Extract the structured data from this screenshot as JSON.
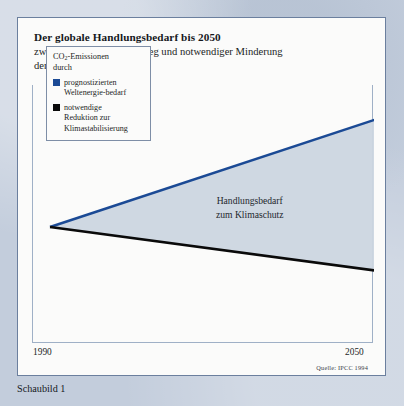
{
  "card": {
    "title": "Der globale Handlungsbedarf  bis 2050",
    "subtitle_line1": "zwischen erwartetem Anstieg und notwendiger Minderung",
    "subtitle_line2_pre": "der CO",
    "subtitle_line2_sub": "2",
    "subtitle_line2_post": "-Emissionen"
  },
  "legend": {
    "head_line1_pre": "CO",
    "head_line1_sub": "2",
    "head_line1_post": "-Emissionen",
    "head_line2": "durch",
    "items": [
      {
        "color": "#1b4a95",
        "line1": "prognostizierten",
        "line2": "Weltenergie-bedarf"
      },
      {
        "color": "#0a0a0a",
        "line1": "notwendige",
        "line2": "Reduktion zur",
        "line3": "Klimastabilisierung"
      }
    ]
  },
  "annotation": {
    "line1": "Handlungsbedarf",
    "line2": "zum Klimaschutz"
  },
  "axis": {
    "x_start": "1990",
    "x_end": "2050"
  },
  "source": "Quelle: IPCC 1994",
  "caption": "Schaubild 1",
  "chart_data": {
    "type": "area",
    "title": "Der globale Handlungsbedarf bis 2050",
    "subtitle": "zwischen erwartetem Anstieg und notwendiger Minderung der CO2-Emissionen",
    "xlabel": "",
    "ylabel": "CO2-Emissionen",
    "x": [
      1990,
      2050
    ],
    "xlim": [
      1990,
      2050
    ],
    "ylim": [
      0,
      100
    ],
    "grid": false,
    "legend_position": "upper-left",
    "series": [
      {
        "name": "prognostizierten Weltenergie-bedarf",
        "color": "#1b4a95",
        "values": [
          44,
          96
        ],
        "note": "projected rise in global energy demand"
      },
      {
        "name": "notwendige Reduktion zur Klimastabilisierung",
        "color": "#0a0a0a",
        "values": [
          44,
          23
        ],
        "note": "required reduction for climate stabilisation"
      }
    ],
    "fill_between": {
      "label": "Handlungsbedarf zum Klimaschutz",
      "color": "#ccd6e0",
      "upper_series": "prognostizierten Weltenergie-bedarf",
      "lower_series": "notwendige Reduktion zur Klimastabilisierung"
    },
    "annotations": [
      {
        "text": "Handlungsbedarf zum Klimaschutz",
        "x": 2028,
        "y": 58
      }
    ],
    "source": "Quelle: IPCC 1994"
  }
}
